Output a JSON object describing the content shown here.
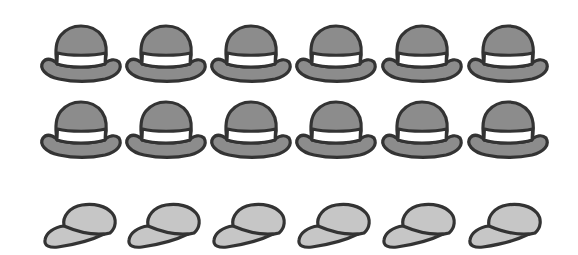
{
  "illustration": {
    "rows": [
      {
        "kind": "bowler-hat",
        "count": 6,
        "top": 24,
        "x_positions": [
          39,
          124,
          209,
          294,
          380,
          466
        ]
      },
      {
        "kind": "bowler-hat",
        "count": 6,
        "top": 100,
        "x_positions": [
          39,
          124,
          209,
          294,
          380,
          466
        ]
      },
      {
        "kind": "baseball-cap",
        "count": 6,
        "top": 202,
        "x_positions": [
          42,
          126,
          211,
          296,
          381,
          467
        ]
      }
    ],
    "colors": {
      "outline": "#333333",
      "bowler_fill": "#8c8c8c",
      "bowler_band": "#ffffff",
      "cap_fill": "#c6c6c6",
      "background": "#ffffff"
    },
    "totals": {
      "bowler_hats": 12,
      "baseball_caps": 6
    }
  }
}
